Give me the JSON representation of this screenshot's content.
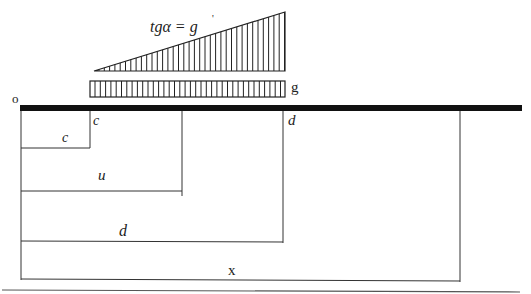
{
  "diagram": {
    "formula_label": "tgα = g",
    "formula_prime": "'",
    "distributed_load_label": "g",
    "origin_label": "o",
    "beam": {
      "color": "#111111"
    },
    "dimensions": {
      "c_top": "c",
      "c": "c",
      "u": "u",
      "d_top": "d",
      "d": "d",
      "x": "x"
    }
  }
}
